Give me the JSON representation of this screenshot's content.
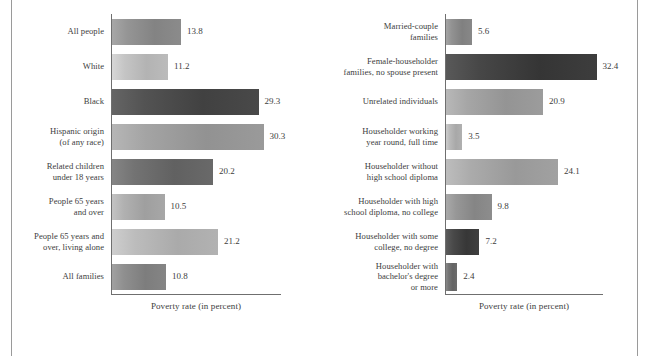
{
  "figure": {
    "background_color": "#ffffff",
    "border_color": "#9a9a9a",
    "axis_color": "#6f6f6f",
    "text_color": "#3d3d3d"
  },
  "chart_data": [
    {
      "type": "bar",
      "orientation": "horizontal",
      "title": "",
      "xlabel": "Poverty rate (in percent)",
      "ylabel": "",
      "xlim": [
        0,
        34
      ],
      "grid": false,
      "legend": "none",
      "value_label_format": "one-decimal",
      "categories": [
        "All people",
        "White",
        "Black",
        "Hispanic origin\n(of any race)",
        "Related children\nunder 18 years",
        "People 65 years\nand over",
        "People 65 years and\nover, living alone",
        "All families"
      ],
      "values": [
        13.8,
        11.2,
        29.3,
        30.3,
        20.2,
        10.5,
        21.2,
        10.8
      ],
      "bar_colors": [
        "#8d8d8d",
        "#bdbdbd",
        "#4b4b4b",
        "#9c9c9c",
        "#6b6b6b",
        "#a9a9a9",
        "#b4b4b4",
        "#878787"
      ]
    },
    {
      "type": "bar",
      "orientation": "horizontal",
      "title": "",
      "xlabel": "Poverty rate (in percent)",
      "ylabel": "",
      "xlim": [
        0,
        34
      ],
      "grid": false,
      "legend": "none",
      "value_label_format": "one-decimal",
      "categories": [
        "Married-couple\nfamilies",
        "Female-householder\nfamilies, no spouse present",
        "Unrelated individuals",
        "Householder working\nyear round, full time",
        "Householder without\nhigh school diploma",
        "Householder with high\nschool diploma, no college",
        "Householder with some\ncollege, no degree",
        "Householder with\nbachelor's degree\nor more"
      ],
      "values": [
        5.6,
        32.4,
        20.9,
        3.5,
        24.1,
        9.8,
        7.2,
        2.4
      ],
      "bar_colors": [
        "#8a8a8a",
        "#3f3f3f",
        "#9e9e9e",
        "#b2b2b2",
        "#a3a3a3",
        "#8f8f8f",
        "#414141",
        "#6e6e6e"
      ]
    }
  ],
  "left_panel": {
    "axis_title": "Poverty rate (in percent)",
    "rows": [
      {
        "label_line1": "All people",
        "label_line2": "",
        "label_line3": "",
        "value": "13.8"
      },
      {
        "label_line1": "White",
        "label_line2": "",
        "label_line3": "",
        "value": "11.2"
      },
      {
        "label_line1": "Black",
        "label_line2": "",
        "label_line3": "",
        "value": "29.3"
      },
      {
        "label_line1": "Hispanic origin",
        "label_line2": "(of any race)",
        "label_line3": "",
        "value": "30.3"
      },
      {
        "label_line1": "Related children",
        "label_line2": "under 18 years",
        "label_line3": "",
        "value": "20.2"
      },
      {
        "label_line1": "People 65 years",
        "label_line2": "and over",
        "label_line3": "",
        "value": "10.5"
      },
      {
        "label_line1": "People 65 years and",
        "label_line2": "over, living alone",
        "label_line3": "",
        "value": "21.2"
      },
      {
        "label_line1": "All families",
        "label_line2": "",
        "label_line3": "",
        "value": "10.8"
      }
    ]
  },
  "right_panel": {
    "axis_title": "Poverty rate (in percent)",
    "rows": [
      {
        "label_line1": "Married-couple",
        "label_line2": "families",
        "label_line3": "",
        "value": "5.6"
      },
      {
        "label_line1": "Female-householder",
        "label_line2": "families, no spouse present",
        "label_line3": "",
        "value": "32.4"
      },
      {
        "label_line1": "Unrelated individuals",
        "label_line2": "",
        "label_line3": "",
        "value": "20.9"
      },
      {
        "label_line1": "Householder working",
        "label_line2": "year round, full time",
        "label_line3": "",
        "value": "3.5"
      },
      {
        "label_line1": "Householder without",
        "label_line2": "high school diploma",
        "label_line3": "",
        "value": "24.1"
      },
      {
        "label_line1": "Householder with high",
        "label_line2": "school diploma, no college",
        "label_line3": "",
        "value": "9.8"
      },
      {
        "label_line1": "Householder with some",
        "label_line2": "college, no degree",
        "label_line3": "",
        "value": "7.2"
      },
      {
        "label_line1": "Householder with",
        "label_line2": "bachelor's degree",
        "label_line3": "or more",
        "value": "2.4"
      }
    ]
  }
}
